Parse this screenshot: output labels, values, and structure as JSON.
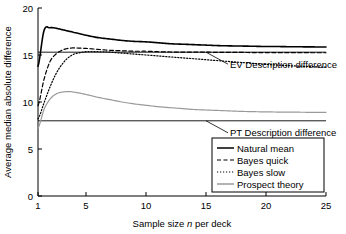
{
  "chart_data": {
    "type": "line",
    "title": "",
    "xlabel": "Sample size n per deck",
    "xlabel_plain": "Sample size ",
    "xlabel_italic": "n",
    "xlabel_tail": " per deck",
    "ylabel": "Average median absolute difference",
    "xlim": [
      1,
      25
    ],
    "ylim": [
      0,
      20
    ],
    "xticks": [
      1,
      5,
      10,
      15,
      20,
      25
    ],
    "xtick_labels": [
      "1",
      "5",
      "10",
      "15",
      "20",
      "25"
    ],
    "yticks": [
      0,
      5,
      10,
      15,
      20
    ],
    "ytick_labels": [
      "0",
      "5",
      "10",
      "15",
      "20"
    ],
    "grid": false,
    "legend_position": "lower right",
    "x": [
      1,
      1.5,
      2,
      2.5,
      3,
      3.5,
      4,
      5,
      6,
      7,
      8,
      9,
      10,
      11,
      12,
      13,
      14,
      15,
      16,
      17,
      18,
      19,
      20,
      21,
      22,
      23,
      24,
      25
    ],
    "series": [
      {
        "name": "Natural mean",
        "style": "solid",
        "color": "#000000",
        "width": 1.6,
        "values": [
          13.8,
          17.6,
          17.9,
          17.85,
          17.7,
          17.55,
          17.4,
          17.1,
          16.85,
          16.7,
          16.55,
          16.45,
          16.4,
          16.3,
          16.2,
          16.15,
          16.1,
          16.05,
          16.0,
          15.97,
          15.95,
          15.93,
          15.9,
          15.9,
          15.88,
          15.87,
          15.86,
          15.85
        ]
      },
      {
        "name": "Bayes quick",
        "style": "dashed",
        "color": "#000000",
        "width": 1.2,
        "values": [
          9.6,
          12.4,
          14.3,
          15.1,
          15.5,
          15.7,
          15.75,
          15.7,
          15.6,
          15.5,
          15.45,
          15.4,
          15.4,
          15.35,
          15.32,
          15.3,
          15.3,
          15.3,
          15.28,
          15.28,
          15.27,
          15.26,
          15.26,
          15.25,
          15.25,
          15.25,
          15.24,
          15.24
        ]
      },
      {
        "name": "Bayes slow",
        "style": "dotted",
        "color": "#000000",
        "width": 1.2,
        "values": [
          8.2,
          9.9,
          11.6,
          13.0,
          14.0,
          14.7,
          15.1,
          15.35,
          15.35,
          15.3,
          15.2,
          15.1,
          15.0,
          14.9,
          14.8,
          14.7,
          14.6,
          14.5,
          14.4,
          14.3,
          14.2,
          14.1,
          14.0,
          13.93,
          13.86,
          13.8,
          13.75,
          13.7
        ]
      },
      {
        "name": "Prospect theory",
        "style": "solid",
        "color": "#9a9a9a",
        "width": 1.2,
        "values": [
          7.2,
          9.2,
          10.3,
          10.85,
          11.05,
          11.1,
          11.05,
          10.8,
          10.5,
          10.25,
          10.0,
          9.8,
          9.65,
          9.5,
          9.4,
          9.3,
          9.2,
          9.15,
          9.1,
          9.05,
          9.0,
          8.97,
          8.95,
          8.93,
          8.92,
          8.91,
          8.9,
          8.9
        ]
      }
    ],
    "reference_lines": [
      {
        "name": "EV Description difference",
        "value": 15.3,
        "style": "solid",
        "color": "#000000"
      },
      {
        "name": "PT Description difference",
        "value": 8.0,
        "style": "solid",
        "color": "#000000"
      }
    ],
    "annotations": [
      {
        "text": "EV Description difference",
        "target_x": 15.0,
        "target_y": 15.3
      },
      {
        "text": "PT Description difference",
        "target_x": 15.0,
        "target_y": 8.0
      }
    ],
    "legend": [
      {
        "label": "Natural mean",
        "style": "solid",
        "color": "#000000"
      },
      {
        "label": "Bayes quick",
        "style": "dashed",
        "color": "#000000"
      },
      {
        "label": "Bayes slow",
        "style": "dotted",
        "color": "#000000"
      },
      {
        "label": "Prospect theory",
        "style": "solid",
        "color": "#9a9a9a"
      }
    ]
  }
}
